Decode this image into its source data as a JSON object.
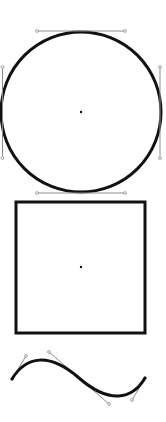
{
  "canvas": {
    "width": 166,
    "height": 422,
    "background": "#ffffff"
  },
  "colors": {
    "stroke": "#111111",
    "handle": "#8c8c8c",
    "anchor_dot": "#111111"
  },
  "shapes": {
    "circle": {
      "cx": 81,
      "cy": 112,
      "r": 80,
      "stroke_width": 3,
      "center_dot": {
        "x": 81,
        "y": 112
      },
      "handles": [
        {
          "name": "top",
          "x1": 37,
          "y1": 31,
          "x2": 125,
          "y2": 31
        },
        {
          "name": "bottom",
          "x1": 37,
          "y1": 193,
          "x2": 125,
          "y2": 193
        },
        {
          "name": "left",
          "x1": 2.5,
          "y1": 67,
          "x2": 2.5,
          "y2": 158
        },
        {
          "name": "right",
          "x1": 160,
          "y1": 67,
          "x2": 160,
          "y2": 158
        }
      ]
    },
    "square": {
      "x": 16,
      "y": 202,
      "width": 129,
      "height": 131,
      "stroke_width": 3,
      "center_dot": {
        "x": 81,
        "y": 267
      }
    },
    "curve": {
      "path": "M12,379 C26,356 49,352 79,378 C109,404 132,400 145,378",
      "stroke_width": 3,
      "handles": [
        {
          "name": "start",
          "x1": 12,
          "y1": 379,
          "x2": 26,
          "y2": 356
        },
        {
          "name": "middle",
          "x1": 49,
          "y1": 352,
          "x2": 109,
          "y2": 404
        },
        {
          "name": "end",
          "x1": 145,
          "y1": 378,
          "x2": 132,
          "y2": 400
        }
      ]
    }
  }
}
